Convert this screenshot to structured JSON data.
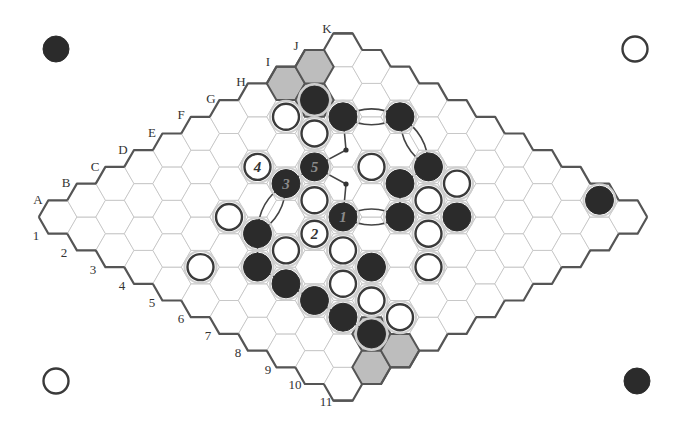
{
  "board": {
    "size": 11,
    "letters": [
      "A",
      "B",
      "C",
      "D",
      "E",
      "F",
      "G",
      "H",
      "I",
      "J",
      "K"
    ],
    "numbers": [
      "1",
      "2",
      "3",
      "4",
      "5",
      "6",
      "7",
      "8",
      "9",
      "10",
      "11"
    ],
    "origin": {
      "x": 58,
      "y": 217
    },
    "dx": 28.5,
    "dy": 16.7,
    "hex_radius": 19.2
  },
  "corner_markers": [
    {
      "position": "top-left",
      "color": "black",
      "x": 56,
      "y": 49
    },
    {
      "position": "top-right",
      "color": "white",
      "x": 635,
      "y": 49
    },
    {
      "position": "bottom-left",
      "color": "white",
      "x": 56,
      "y": 381
    },
    {
      "position": "bottom-right",
      "color": "black",
      "x": 637,
      "y": 381
    }
  ],
  "highlighted_cells": [
    "I1",
    "J1",
    "I2",
    "B11",
    "C11",
    "C10"
  ],
  "stones": [
    {
      "cell": "I2",
      "color": "black"
    },
    {
      "cell": "I3",
      "color": "black"
    },
    {
      "cell": "J4",
      "color": "black"
    },
    {
      "cell": "H2",
      "color": "white"
    },
    {
      "cell": "H3",
      "color": "white"
    },
    {
      "cell": "F3",
      "color": "white",
      "label": "4"
    },
    {
      "cell": "G4",
      "color": "black",
      "label": "5"
    },
    {
      "cell": "F4",
      "color": "black",
      "label": "3"
    },
    {
      "cell": "F5",
      "color": "white"
    },
    {
      "cell": "F6",
      "color": "black",
      "label": "1"
    },
    {
      "cell": "E6",
      "color": "white",
      "label": "2"
    },
    {
      "cell": "H5",
      "color": "white"
    },
    {
      "cell": "H6",
      "color": "black"
    },
    {
      "cell": "I6",
      "color": "black"
    },
    {
      "cell": "I7",
      "color": "white"
    },
    {
      "cell": "H7",
      "color": "white"
    },
    {
      "cell": "G7",
      "color": "black"
    },
    {
      "cell": "H8",
      "color": "black"
    },
    {
      "cell": "G8",
      "color": "white"
    },
    {
      "cell": "D4",
      "color": "white"
    },
    {
      "cell": "D5",
      "color": "black"
    },
    {
      "cell": "D6",
      "color": "white"
    },
    {
      "cell": "E7",
      "color": "white"
    },
    {
      "cell": "B5",
      "color": "white"
    },
    {
      "cell": "C6",
      "color": "black"
    },
    {
      "cell": "E8",
      "color": "black"
    },
    {
      "cell": "F9",
      "color": "white"
    },
    {
      "cell": "C7",
      "color": "black"
    },
    {
      "cell": "D8",
      "color": "white"
    },
    {
      "cell": "C8",
      "color": "black"
    },
    {
      "cell": "D9",
      "color": "white"
    },
    {
      "cell": "C9",
      "color": "black"
    },
    {
      "cell": "D10",
      "color": "white"
    },
    {
      "cell": "C10",
      "color": "black"
    },
    {
      "cell": "K10",
      "color": "black"
    }
  ],
  "connections": {
    "bridges": [
      [
        "I3",
        "J4"
      ],
      [
        "J4",
        "I6"
      ],
      [
        "F6",
        "G7"
      ],
      [
        "F4",
        "D5"
      ]
    ],
    "adjacent_links": [
      [
        "H6",
        "I6"
      ],
      [
        "H6",
        "G7"
      ],
      [
        "F4",
        "G4"
      ],
      [
        "D5",
        "C6"
      ],
      [
        "C6",
        "C7"
      ],
      [
        "C7",
        "C8"
      ],
      [
        "C8",
        "C9"
      ],
      [
        "C9",
        "C10"
      ]
    ],
    "dotted_paths": [
      {
        "from": "I3",
        "via": {
          "x": 346,
          "y": 150
        },
        "to": "G4"
      },
      {
        "from": "G4",
        "via": {
          "x": 346,
          "y": 184
        },
        "to": "F6"
      }
    ]
  },
  "labels": {
    "letter_positions": [
      {
        "text": "A",
        "x": 38,
        "y": 204
      },
      {
        "text": "B",
        "x": 66,
        "y": 187
      },
      {
        "text": "C",
        "x": 95,
        "y": 171
      },
      {
        "text": "D",
        "x": 123,
        "y": 154
      },
      {
        "text": "E",
        "x": 152,
        "y": 137
      },
      {
        "text": "F",
        "x": 181,
        "y": 119
      },
      {
        "text": "G",
        "x": 211,
        "y": 103
      },
      {
        "text": "H",
        "x": 241,
        "y": 86
      },
      {
        "text": "I",
        "x": 268,
        "y": 66
      },
      {
        "text": "J",
        "x": 296,
        "y": 50
      },
      {
        "text": "K",
        "x": 327,
        "y": 33
      }
    ],
    "number_positions": [
      {
        "text": "1",
        "x": 36,
        "y": 240
      },
      {
        "text": "2",
        "x": 64,
        "y": 257
      },
      {
        "text": "3",
        "x": 93,
        "y": 274
      },
      {
        "text": "4",
        "x": 122,
        "y": 290
      },
      {
        "text": "5",
        "x": 152,
        "y": 307
      },
      {
        "text": "6",
        "x": 181,
        "y": 323
      },
      {
        "text": "7",
        "x": 208,
        "y": 340
      },
      {
        "text": "8",
        "x": 238,
        "y": 357
      },
      {
        "text": "9",
        "x": 268,
        "y": 374
      },
      {
        "text": "10",
        "x": 295,
        "y": 389
      },
      {
        "text": "11",
        "x": 326,
        "y": 406
      }
    ]
  }
}
